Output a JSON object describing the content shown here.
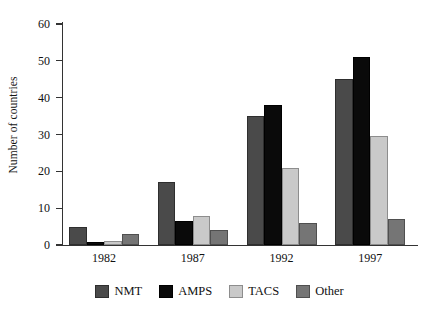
{
  "chart_data": {
    "type": "bar",
    "title": "",
    "subtitle": "",
    "xlabel": "",
    "ylabel": "Number of countries",
    "categories": [
      "1982",
      "1987",
      "1992",
      "1997"
    ],
    "series": [
      {
        "name": "NMT",
        "color": "#4a4a4a",
        "values": [
          5,
          17,
          35,
          45
        ]
      },
      {
        "name": "AMPS",
        "color": "#0a0a0a",
        "values": [
          0.7,
          6.5,
          38,
          51
        ]
      },
      {
        "name": "TACS",
        "color": "#c9c9c9",
        "values": [
          1,
          8,
          21,
          29.5
        ]
      },
      {
        "name": "Other",
        "color": "#757575",
        "values": [
          3,
          4,
          6,
          7
        ]
      }
    ],
    "ylim": [
      0,
      60
    ],
    "ytick_labels": [
      "0",
      "10",
      "20",
      "30",
      "40",
      "50",
      "60"
    ],
    "ytick_values": [
      0,
      10,
      20,
      30,
      40,
      50,
      60
    ],
    "grid": false,
    "legend_position": "bottom",
    "grouped": true
  }
}
